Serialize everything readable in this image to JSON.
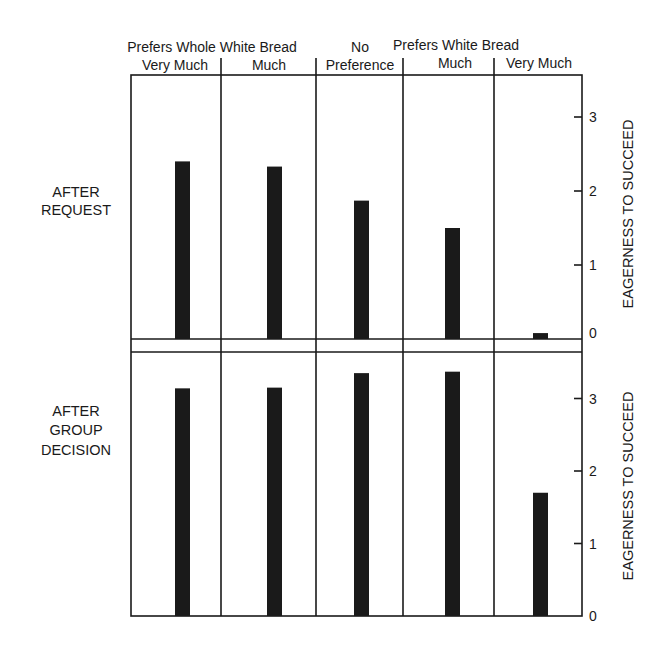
{
  "chart_data": {
    "type": "bar",
    "title": "",
    "group_header_left": "Prefers Whole White Bread",
    "group_header_right": "Prefers White Bread",
    "categories": [
      "Very Much",
      "Much",
      "No Preference",
      "Much",
      "Very Much"
    ],
    "category_headers": [
      [
        "Prefers Whole White Bread",
        "Very Much"
      ],
      [
        "",
        "Much"
      ],
      [
        "No",
        "Preference"
      ],
      [
        "Prefers White Bread",
        "Much"
      ],
      [
        "",
        "Very Much"
      ]
    ],
    "panels": [
      {
        "name": "After Request",
        "label_lines": [
          "AFTER",
          "REQUEST"
        ],
        "ylabel": "EAGERNESS TO SUCCEED",
        "ylim": [
          0,
          3.5
        ],
        "yticks": [
          0,
          1,
          2,
          3
        ],
        "values": [
          2.4,
          2.33,
          1.87,
          1.5,
          0.08
        ]
      },
      {
        "name": "After Group Decision",
        "label_lines": [
          "AFTER",
          "GROUP",
          "DECISION"
        ],
        "ylabel": "EAGERNESS TO SUCCEED",
        "ylim": [
          0,
          3.5
        ],
        "yticks": [
          0,
          1,
          2,
          3
        ],
        "values": [
          3.14,
          3.15,
          3.35,
          3.37,
          1.7
        ]
      }
    ],
    "series": [
      {
        "name": "After Request",
        "values": [
          2.4,
          2.33,
          1.87,
          1.5,
          0.08
        ]
      },
      {
        "name": "After Group Decision",
        "values": [
          3.14,
          3.15,
          3.35,
          3.37,
          1.7
        ]
      }
    ],
    "xlabel": "",
    "ylabel": "EAGERNESS TO SUCCEED",
    "grid": false,
    "legend": "none",
    "bar_color": "#1a1a1a"
  }
}
